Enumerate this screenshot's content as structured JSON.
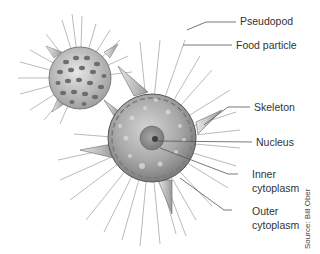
{
  "diagram": {
    "labels": {
      "pseudopod": "Pseudopod",
      "food_particle": "Food particle",
      "skeleton": "Skeleton",
      "nucleus": "Nucleus",
      "inner_cytoplasm_1": "Inner",
      "inner_cytoplasm_2": "cytoplasm",
      "outer_cytoplasm_1": "Outer",
      "outer_cytoplasm_2": "cytoplasm"
    },
    "source": "Source: Bill Ober",
    "colors": {
      "line": "#555555",
      "text": "#333333",
      "cell_body": "#a8a8a8",
      "nucleus": "#8a8a8a",
      "spines": "#b8b8b8"
    }
  }
}
